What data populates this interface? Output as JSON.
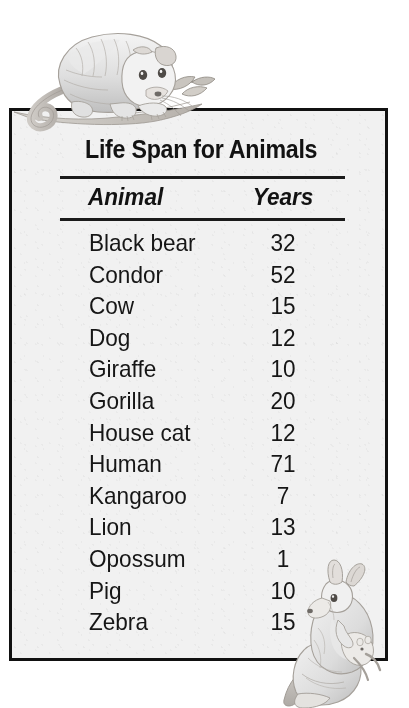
{
  "page": {
    "background_color": "#ffffff"
  },
  "card": {
    "background_color": "#f1f1f1",
    "border_color": "#111111",
    "title": "Life Span for Animals"
  },
  "table": {
    "columns": [
      "Animal",
      "Years"
    ],
    "rows": [
      {
        "animal": "Black bear",
        "years": "32"
      },
      {
        "animal": "Condor",
        "years": "52"
      },
      {
        "animal": "Cow",
        "years": "15"
      },
      {
        "animal": "Dog",
        "years": "12"
      },
      {
        "animal": "Giraffe",
        "years": "10"
      },
      {
        "animal": "Gorilla",
        "years": "20"
      },
      {
        "animal": "House cat",
        "years": "12"
      },
      {
        "animal": "Human",
        "years": "71"
      },
      {
        "animal": "Kangaroo",
        "years": "7"
      },
      {
        "animal": "Lion",
        "years": "13"
      },
      {
        "animal": "Opossum",
        "years": "1"
      },
      {
        "animal": "Pig",
        "years": "10"
      },
      {
        "animal": "Zebra",
        "years": "15"
      }
    ]
  },
  "illustrations": [
    {
      "name": "opossum-illustration",
      "subject": "Opossum on a branch",
      "style": "grayscale pencil drawing"
    },
    {
      "name": "kangaroo-illustration",
      "subject": "Kangaroo with joey in pouch",
      "style": "grayscale pencil drawing"
    }
  ]
}
